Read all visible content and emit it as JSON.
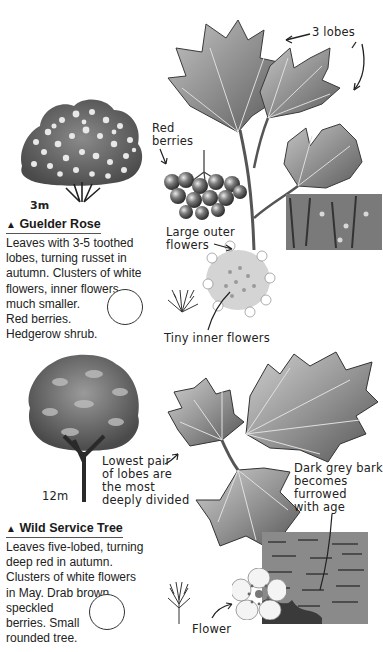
{
  "guelder_rose": {
    "height_label": "3m",
    "title_marker": "▲",
    "title": "Guelder Rose",
    "description_lines": [
      "Leaves with 3-5 toothed",
      "lobes, turning russet in",
      "autumn. Clusters of white",
      "flowers, inner flowers",
      "much smaller.",
      "Red berries.",
      "Hedgerow shrub."
    ],
    "annotations": {
      "lobes": "3 lobes",
      "berries_line1": "Red",
      "berries_line2": "berries",
      "outer_flowers_line1": "Large outer",
      "outer_flowers_line2": "flowers",
      "inner_flowers": "Tiny inner flowers"
    }
  },
  "wild_service_tree": {
    "height_label": "12m",
    "title_marker": "▲",
    "title": "Wild Service Tree",
    "description_lines": [
      "Leaves five-lobed, turning",
      "deep red in autumn.",
      "Clusters of white flowers",
      "in May. Drab brown,",
      "speckled",
      "berries. Small",
      "rounded tree."
    ],
    "annotations": {
      "lobes_line1": "Lowest pair",
      "lobes_line2": "of lobes are",
      "lobes_line3": "the most",
      "lobes_line4": "deeply divided",
      "bark_line1": "Dark grey bark",
      "bark_line2": "becomes",
      "bark_line3": "furrowed",
      "bark_line4": "with age",
      "flower": "Flower"
    }
  },
  "colors": {
    "ink": "#1a1a1a",
    "leaf_dark": "#6b6b6b",
    "leaf_light": "#a9a9a9",
    "bark": "#7a7a7a"
  }
}
